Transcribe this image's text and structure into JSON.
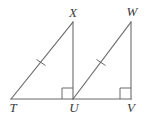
{
  "figure": {
    "type": "geometry-diagram",
    "canvas": {
      "width": 150,
      "height": 117
    },
    "stroke_color": "#6b6b6b",
    "label_color": "#3a3a3a",
    "stroke_width": 1.1,
    "baseline": {
      "from": "T",
      "to": "V",
      "y": 99
    },
    "points": {
      "T": {
        "x": 11,
        "y": 99,
        "label": "T",
        "label_x": 13,
        "label_y": 101
      },
      "U": {
        "x": 73,
        "y": 99,
        "label": "U",
        "label_x": 74,
        "label_y": 101
      },
      "V": {
        "x": 131,
        "y": 99,
        "label": "V",
        "label_x": 131,
        "label_y": 101
      },
      "X": {
        "x": 73,
        "y": 22,
        "label": "X",
        "label_x": 73,
        "label_y": 6
      },
      "W": {
        "x": 131,
        "y": 22,
        "label": "W",
        "label_x": 132,
        "label_y": 5
      }
    },
    "segments": [
      {
        "name": "TX",
        "from": "T",
        "to": "X",
        "role": "hypotenuse",
        "ticks": 1
      },
      {
        "name": "XU",
        "from": "X",
        "to": "U",
        "role": "vertical-leg",
        "ticks": 0
      },
      {
        "name": "TU",
        "from": "T",
        "to": "U",
        "role": "horizontal-leg",
        "ticks": 0
      },
      {
        "name": "UW",
        "from": "U",
        "to": "W",
        "role": "hypotenuse",
        "ticks": 1
      },
      {
        "name": "WV",
        "from": "W",
        "to": "V",
        "role": "vertical-leg",
        "ticks": 0
      },
      {
        "name": "UV",
        "from": "U",
        "to": "V",
        "role": "horizontal-leg",
        "ticks": 0
      }
    ],
    "tick_marks": [
      {
        "on": "TX",
        "cx": 41,
        "cy": 62.5,
        "count": 1
      },
      {
        "on": "UW",
        "cx": 101,
        "cy": 62.5,
        "count": 1
      }
    ],
    "right_angles": [
      {
        "at": "U",
        "triangle": "TUX",
        "size": 11,
        "orientation": "left-of-vertical"
      },
      {
        "at": "V",
        "triangle": "UVW",
        "size": 11,
        "orientation": "left-of-vertical"
      }
    ],
    "triangles": [
      {
        "name": "TUX",
        "vertices": [
          "T",
          "U",
          "X"
        ]
      },
      {
        "name": "UVW",
        "vertices": [
          "U",
          "V",
          "W"
        ]
      }
    ]
  }
}
